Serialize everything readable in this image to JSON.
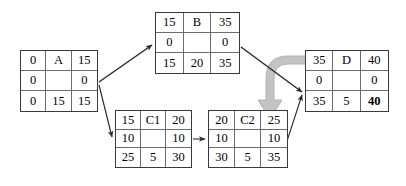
{
  "diagram": {
    "node_cell_layout": [
      [
        "early_start",
        "activity_name",
        "early_finish"
      ],
      [
        "free_float",
        "",
        "total_float"
      ],
      [
        "late_start",
        "duration",
        "late_finish"
      ]
    ],
    "nodes": [
      {
        "id": "A",
        "name": "A",
        "rows": [
          [
            "0",
            "A",
            "15"
          ],
          [
            "0",
            "",
            "0"
          ],
          [
            "0",
            "15",
            "15"
          ]
        ],
        "bold_cells": []
      },
      {
        "id": "B",
        "name": "B",
        "rows": [
          [
            "15",
            "B",
            "35"
          ],
          [
            "0",
            "",
            "0"
          ],
          [
            "15",
            "20",
            "35"
          ]
        ],
        "bold_cells": []
      },
      {
        "id": "C1",
        "name": "C1",
        "rows": [
          [
            "15",
            "C1",
            "20"
          ],
          [
            "10",
            "",
            "10"
          ],
          [
            "25",
            "5",
            "30"
          ]
        ],
        "bold_cells": []
      },
      {
        "id": "C2",
        "name": "C2",
        "rows": [
          [
            "20",
            "C2",
            "25"
          ],
          [
            "10",
            "",
            "10"
          ],
          [
            "30",
            "5",
            "35"
          ]
        ],
        "bold_cells": []
      },
      {
        "id": "D",
        "name": "D",
        "rows": [
          [
            "35",
            "D",
            "40"
          ],
          [
            "0",
            "",
            "0"
          ],
          [
            "35",
            "5",
            "40"
          ]
        ],
        "bold_cells": [
          "r3c3"
        ]
      }
    ],
    "edges": [
      {
        "from": "A",
        "to": "B",
        "style": "thin-arrow"
      },
      {
        "from": "A",
        "to": "C1",
        "style": "thin-arrow"
      },
      {
        "from": "C1",
        "to": "C2",
        "style": "thin-arrow"
      },
      {
        "from": "C2",
        "to": "D",
        "style": "thin-arrow"
      },
      {
        "from": "B",
        "to": "D",
        "style": "thin-arrow"
      }
    ],
    "callout_arrow": {
      "shape": "curved-elbow-down",
      "color": "#bfbfbf"
    },
    "colors": {
      "node_border": "#3a3a3a",
      "grid_line": "#6b6b6b",
      "edge": "#2b2b2b",
      "callout": "#bfbfbf",
      "text": "#000000",
      "background": "#ffffff"
    }
  }
}
